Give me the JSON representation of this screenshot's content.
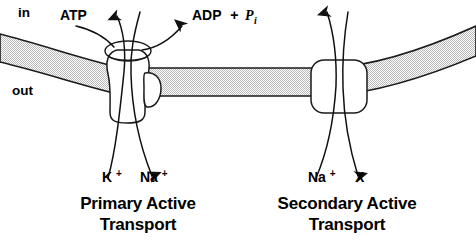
{
  "figure": {
    "background_color": "#ffffff",
    "line_color": "#111111",
    "membrane_fill_color": "#d8d8d8"
  },
  "compartments": {
    "inside_label": "in",
    "outside_label": "out"
  },
  "molecules": {
    "atp_label": "ATP",
    "adp_label": "ADP",
    "plus_label": "+",
    "phosphate_symbol": "P",
    "phosphate_subscript": "i"
  },
  "primary": {
    "caption_line1": "Primary Active",
    "caption_line2": "Transport",
    "ion_left_base": "K",
    "ion_left_charge": "+",
    "ion_right_base": "Na",
    "ion_right_charge": "+"
  },
  "secondary": {
    "caption_line1": "Secondary Active",
    "caption_line2": "Transport",
    "ion_left_base": "Na",
    "ion_left_charge": "+",
    "ion_right_base": "X",
    "ion_right_charge": ""
  },
  "icons": {
    "pump_protein": "primary-pump-protein",
    "carrier_protein": "secondary-carrier-protein",
    "membrane": "lipid-membrane-band"
  }
}
